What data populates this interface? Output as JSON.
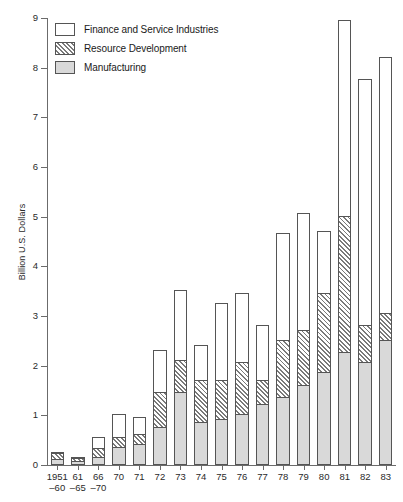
{
  "chart_data": {
    "type": "bar",
    "stacked": true,
    "title": "",
    "xlabel": "",
    "ylabel": "Billion U.S. Dollars",
    "ylim": [
      0,
      9
    ],
    "yticks": [
      0,
      1,
      2,
      3,
      4,
      5,
      6,
      7,
      8,
      9
    ],
    "ytick_labels": [
      "0",
      "1",
      "2",
      "3",
      "4",
      "5",
      "6",
      "7",
      "8",
      "9"
    ],
    "grid": false,
    "legend_position": "top-left",
    "categories": [
      "1951–60",
      "61–65",
      "66–70",
      "70",
      "71",
      "72",
      "73",
      "74",
      "75",
      "76",
      "77",
      "78",
      "79",
      "80",
      "81",
      "82",
      "83"
    ],
    "category_lines": [
      [
        "1951",
        "–60"
      ],
      [
        "61",
        "–65"
      ],
      [
        "66",
        "–70"
      ],
      [
        "70",
        ""
      ],
      [
        "71",
        ""
      ],
      [
        "72",
        ""
      ],
      [
        "73",
        ""
      ],
      [
        "74",
        ""
      ],
      [
        "75",
        ""
      ],
      [
        "76",
        ""
      ],
      [
        "77",
        ""
      ],
      [
        "78",
        ""
      ],
      [
        "79",
        ""
      ],
      [
        "80",
        ""
      ],
      [
        "81",
        ""
      ],
      [
        "82",
        ""
      ],
      [
        "83",
        ""
      ]
    ],
    "series": [
      {
        "name": "Manufacturing",
        "key": "manufacturing",
        "style": "solid-gray",
        "values": [
          0.1,
          0.07,
          0.15,
          0.35,
          0.4,
          0.75,
          1.45,
          0.85,
          0.9,
          1.0,
          1.2,
          1.35,
          1.6,
          1.85,
          2.25,
          2.05,
          2.5
        ]
      },
      {
        "name": "Resource Development",
        "key": "resource_development",
        "style": "diagonal-hatch",
        "values": [
          0.12,
          0.06,
          0.18,
          0.2,
          0.2,
          0.7,
          0.65,
          0.85,
          0.8,
          1.05,
          0.5,
          1.15,
          1.1,
          1.6,
          2.75,
          0.75,
          0.55
        ]
      },
      {
        "name": "Finance and Service Industries",
        "key": "finance_service",
        "style": "white",
        "values": [
          0.03,
          0.02,
          0.22,
          0.45,
          0.35,
          0.85,
          1.4,
          0.7,
          1.55,
          1.4,
          1.1,
          2.15,
          2.35,
          1.25,
          3.95,
          4.95,
          5.15
        ]
      }
    ],
    "totals": [
      0.25,
      0.15,
      0.55,
      1.0,
      0.95,
      2.3,
      3.5,
      2.4,
      3.25,
      3.45,
      2.8,
      4.65,
      5.05,
      4.7,
      8.95,
      7.75,
      8.2
    ]
  },
  "legend": {
    "items": [
      {
        "label": "Finance and Service Industries",
        "swatch": "white"
      },
      {
        "label": "Resource Development",
        "swatch": "hatch"
      },
      {
        "label": "Manufacturing",
        "swatch": "gray"
      }
    ]
  },
  "colors": {
    "axis": "#6b6b6b",
    "outline": "#555555",
    "manufacturing": "#d9d9d9",
    "finance": "#ffffff",
    "hatch": "#7a7a7a",
    "text": "#1a1a1a"
  }
}
